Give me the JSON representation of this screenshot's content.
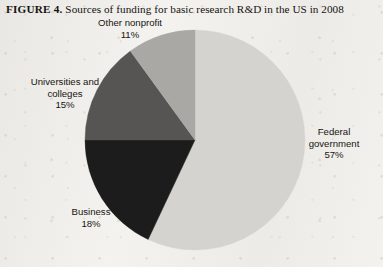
{
  "caption": {
    "figure_number": "FIGURE 4.",
    "text": "Sources of funding for basic research R&D in the US in 2008"
  },
  "chart_data": {
    "type": "pie",
    "title": "Sources of funding for basic research R&D in the US in 2008",
    "categories": [
      "Federal government",
      "Business",
      "Universities and colleges",
      "Other nonprofit"
    ],
    "values": [
      57,
      18,
      15,
      11
    ],
    "unit": "%",
    "total": 101,
    "start_angle_deg": 0,
    "direction": "clockwise",
    "legend": "none",
    "labels_position": "outside",
    "grid": false,
    "slices": [
      {
        "name": "Federal government",
        "label_line1": "Federal",
        "label_line2": "government",
        "value": 57,
        "value_label": "57%",
        "color": "#d4d3d0",
        "start_deg": 0,
        "end_deg": 205.2
      },
      {
        "name": "Business",
        "label_line1": "Business",
        "label_line2": "",
        "value": 18,
        "value_label": "18%",
        "color": "#1d1c1a",
        "start_deg": 205.2,
        "end_deg": 270
      },
      {
        "name": "Universities and colleges",
        "label_line1": "Universities and",
        "label_line2": "colleges",
        "value": 15,
        "value_label": "15%",
        "color": "#565552",
        "start_deg": 270,
        "end_deg": 324
      },
      {
        "name": "Other nonprofit",
        "label_line1": "Other nonprofit",
        "label_line2": "",
        "value": 11,
        "value_label": "11%",
        "color": "#a9a8a4",
        "start_deg": 324,
        "end_deg": 360
      }
    ]
  },
  "colors": {
    "page_background": "#f3f2ef",
    "text": "#17150f",
    "federal": "#d4d3d0",
    "business": "#1d1c1a",
    "universities": "#565552",
    "nonprofit": "#a9a8a4"
  }
}
